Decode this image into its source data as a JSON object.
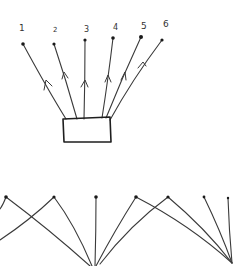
{
  "diagram": {
    "style": "hand-drawn sketch",
    "stroke_color": "#3a3a3a",
    "background": "#ffffff",
    "top_figure": {
      "description": "Six numbered terminals connected by arrowed lines to a central box",
      "labels": [
        {
          "text": "1",
          "x": 19,
          "y": 24
        },
        {
          "text": "2",
          "x": 53,
          "y": 27
        },
        {
          "text": "3",
          "x": 84,
          "y": 26
        },
        {
          "text": "4",
          "x": 113,
          "y": 24
        },
        {
          "text": "5",
          "x": 141,
          "y": 22
        },
        {
          "text": "6",
          "x": 163,
          "y": 20
        }
      ],
      "nodes": [
        {
          "id": 1,
          "x": 23,
          "y": 44
        },
        {
          "id": 2,
          "x": 54,
          "y": 44
        },
        {
          "id": 3,
          "x": 85,
          "y": 40
        },
        {
          "id": 4,
          "x": 113,
          "y": 38
        },
        {
          "id": 5,
          "x": 141,
          "y": 37
        },
        {
          "id": 6,
          "x": 162,
          "y": 40
        }
      ],
      "box": {
        "x1": 63,
        "y1": 119,
        "x2": 110,
        "y2": 142
      }
    },
    "bottom_figure": {
      "description": "Seven terminals whose lines cross and converge to two points at the bottom",
      "nodes": [
        {
          "x": 6,
          "y": 197
        },
        {
          "x": 54,
          "y": 197
        },
        {
          "x": 96,
          "y": 197
        },
        {
          "x": 136,
          "y": 197
        },
        {
          "x": 168,
          "y": 197
        },
        {
          "x": 204,
          "y": 197
        },
        {
          "x": 228,
          "y": 198
        }
      ],
      "convergence_points": [
        {
          "x": 92,
          "y": 266
        },
        {
          "x": 232,
          "y": 263
        }
      ]
    }
  }
}
